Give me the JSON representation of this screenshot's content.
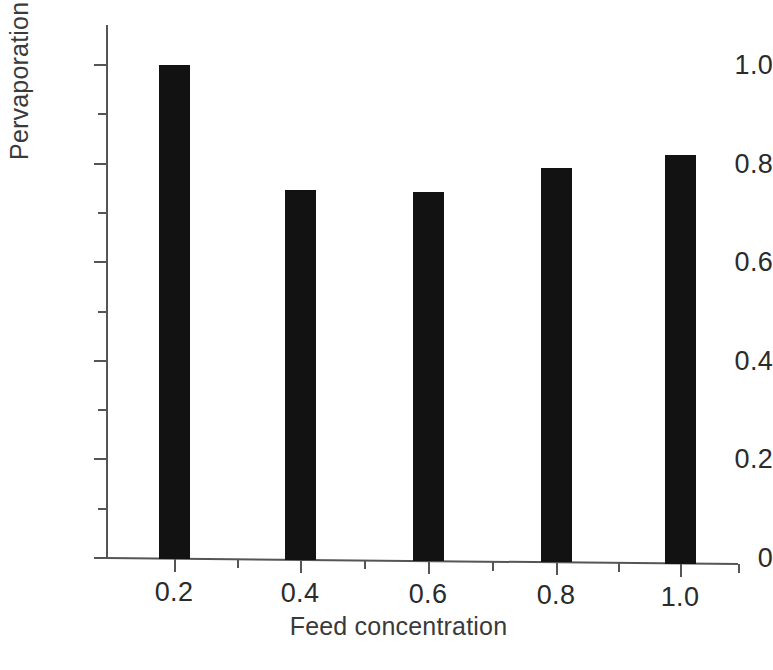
{
  "chart_data": {
    "type": "bar",
    "title": "",
    "subtitle": "",
    "xlabel": "Feed concentration",
    "ylabel": "Pervaporation selectivity",
    "categories": [
      "0.2",
      "0.4",
      "0.6",
      "0.8",
      "1.0"
    ],
    "values": [
      1.0,
      0.747,
      0.743,
      0.791,
      0.818
    ],
    "series": [
      {
        "name": "Pervaporation selectivity",
        "values": [
          1.0,
          0.747,
          0.743,
          0.791,
          0.818
        ]
      }
    ],
    "ylim": [
      0,
      1.08
    ],
    "xlim": [
      0.1,
      1.13
    ],
    "y_ticks": [
      "0",
      "0.2",
      "0.4",
      "0.6",
      "0.8",
      "1.0"
    ],
    "y_tick_values": [
      0,
      0.2,
      0.4,
      0.6,
      0.8,
      1.0
    ],
    "y_minor_tick_values": [
      0.1,
      0.3,
      0.5,
      0.7,
      0.9
    ],
    "x_ticks": [
      "0.2",
      "0.4",
      "0.6",
      "0.8",
      "1.0"
    ],
    "x_tick_values": [
      0.2,
      0.4,
      0.6,
      0.8,
      1.0
    ],
    "x_minor_tick_values": [
      0.3,
      0.5,
      0.7,
      0.9,
      1.1
    ],
    "grid": false,
    "legend": "none",
    "bar_color": "#121212",
    "axis_color": "#555555",
    "text_color": "#2b2b2b",
    "background": "#ffffff"
  }
}
